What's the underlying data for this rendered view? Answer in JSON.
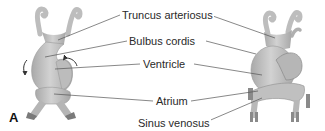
{
  "figure": {
    "panel_label": "A",
    "labels": [
      {
        "id": "truncus",
        "text": "Truncus arteriosus"
      },
      {
        "id": "bulbus",
        "text": "Bulbus cordis"
      },
      {
        "id": "ventricle",
        "text": "Ventricle"
      },
      {
        "id": "atrium",
        "text": "Atrium"
      },
      {
        "id": "sinus",
        "text": "Sinus venosus"
      }
    ],
    "left_structure": "Early heart tube (looping)",
    "right_structure": "Later looped heart",
    "colors": {
      "tissue": "#c4c4c4",
      "tissue_dark": "#8e8e8e",
      "leader_line": "#555555",
      "text": "#2a2a2a"
    }
  }
}
